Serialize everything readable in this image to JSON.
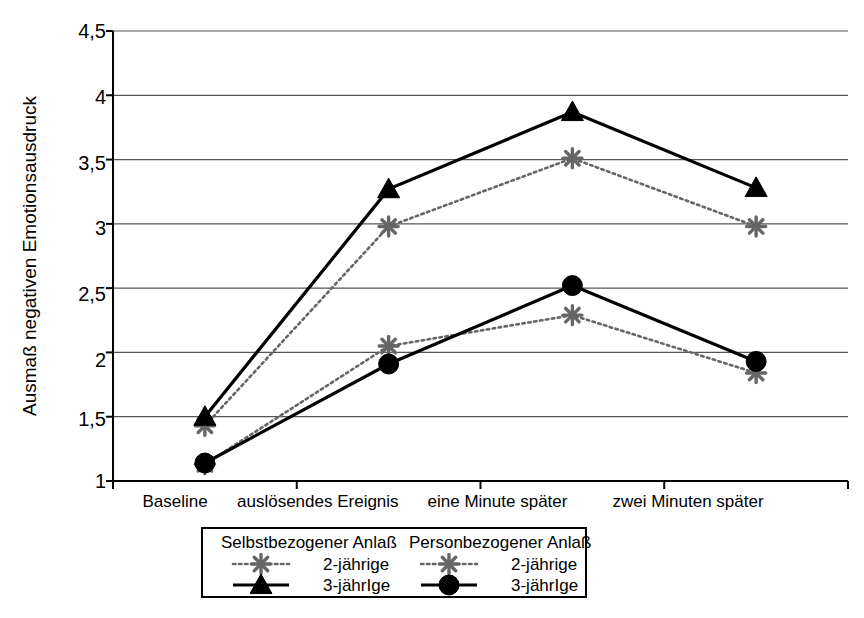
{
  "chart_data": {
    "type": "line",
    "title": "",
    "xlabel": "",
    "ylabel": "Ausmaß negativen Emotionsausdruck",
    "categories": [
      "Baseline",
      "auslösendes Ereignis",
      "eine Minute später",
      "zwei Minuten später"
    ],
    "ylim": [
      1,
      4.5
    ],
    "yticks": [
      "1",
      "1,5",
      "2",
      "2,5",
      "3",
      "3,5",
      "4",
      "4,5"
    ],
    "ytick_values": [
      1,
      1.5,
      2,
      2.5,
      3,
      3.5,
      4,
      4.5
    ],
    "grid": true,
    "legend_position": "bottom",
    "series": [
      {
        "name": "Selbstbezogener Anlaß – 2-jährige",
        "group": "Selbstbezogener Anlaß",
        "age": "2-jährige",
        "marker": "asterisk",
        "line": "dotted",
        "color": "#666666",
        "values": [
          1.43,
          2.98,
          3.51,
          2.98
        ]
      },
      {
        "name": "Selbstbezogener Anlaß – 3-jährIge",
        "group": "Selbstbezogener Anlaß",
        "age": "3-jährIge",
        "marker": "triangle",
        "line": "solid",
        "color": "#000000",
        "values": [
          1.5,
          3.27,
          3.87,
          3.28
        ]
      },
      {
        "name": "Personbezogener Anlaß – 2-jährige",
        "group": "Personbezogener Anlaß",
        "age": "2-jährige",
        "marker": "asterisk",
        "line": "dotted",
        "color": "#666666",
        "values": [
          1.13,
          2.05,
          2.29,
          1.84
        ]
      },
      {
        "name": "Personbezogener Anlaß – 3-jährIge",
        "group": "Personbezogener Anlaß",
        "age": "3-jährIge",
        "marker": "circle",
        "line": "solid",
        "color": "#000000",
        "values": [
          1.14,
          1.91,
          2.52,
          1.93
        ]
      }
    ]
  },
  "axis": {
    "y_title": "Ausmaß negativen Emotionsausdruck",
    "y_labels": [
      "4,5",
      "4",
      "3,5",
      "3",
      "2,5",
      "2",
      "1,5",
      "1"
    ],
    "x_labels": [
      "Baseline",
      "auslösendes Ereignis",
      "eine Minute später",
      "zwei Minuten später"
    ]
  },
  "legend": {
    "groups": [
      {
        "title": "Selbstbezogener Anlaß",
        "entries": [
          {
            "label": "2-jährige",
            "marker": "asterisk-icon",
            "line": "dotted"
          },
          {
            "label": "3-jährIge",
            "marker": "triangle-icon",
            "line": "solid"
          }
        ]
      },
      {
        "title": "Personbezogener Anlaß",
        "entries": [
          {
            "label": "2-jährige",
            "marker": "asterisk-icon",
            "line": "dotted"
          },
          {
            "label": "3-jährIge",
            "marker": "circle-icon",
            "line": "solid"
          }
        ]
      }
    ]
  },
  "colors": {
    "axis": "#000000",
    "grid": "#555555",
    "series_dark": "#000000",
    "series_gray": "#666666",
    "background": "#ffffff"
  }
}
